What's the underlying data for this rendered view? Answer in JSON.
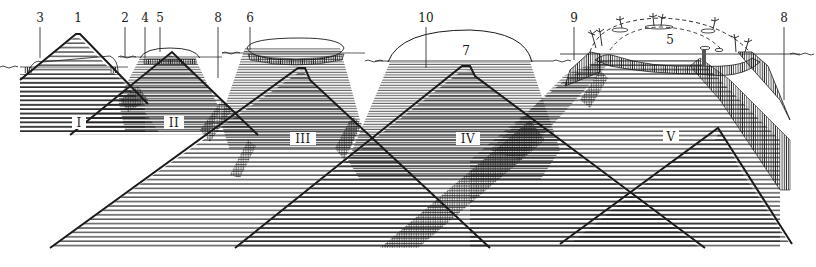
{
  "diagram": {
    "colors": {
      "ink": "#1a1a1a",
      "background": "#ffffff",
      "hatch": "#333333"
    },
    "stages": [
      {
        "id": "I",
        "label": "I"
      },
      {
        "id": "II",
        "label": "II"
      },
      {
        "id": "III",
        "label": "III"
      },
      {
        "id": "IV",
        "label": "IV"
      },
      {
        "id": "V",
        "label": "V"
      }
    ],
    "callouts": [
      {
        "id": "c1",
        "label": "1"
      },
      {
        "id": "c2",
        "label": "2"
      },
      {
        "id": "c3",
        "label": "3"
      },
      {
        "id": "c4",
        "label": "4"
      },
      {
        "id": "c5a",
        "label": "5"
      },
      {
        "id": "c5b",
        "label": "5"
      },
      {
        "id": "c6",
        "label": "6"
      },
      {
        "id": "c7",
        "label": "7"
      },
      {
        "id": "c8a",
        "label": "8"
      },
      {
        "id": "c8b",
        "label": "8"
      },
      {
        "id": "c9",
        "label": "9"
      },
      {
        "id": "c10",
        "label": "10"
      }
    ]
  }
}
